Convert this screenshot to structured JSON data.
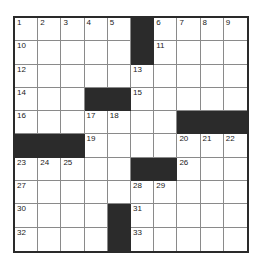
{
  "puzzle": {
    "rows": 10,
    "cols": 10,
    "colors": {
      "black": "#2b2b2b",
      "white": "#ffffff",
      "grid_line": "#8a8a8a",
      "border": "#2a2a2a"
    },
    "layout": [
      "11111#1111",
      "11111#1111",
      "1111111111",
      "111##11111",
      "1111111###",
      "###1111111",
      "11111##111",
      "1111111111",
      "1111#11111",
      "1111#11111"
    ],
    "numbers": [
      {
        "r": 0,
        "c": 0,
        "n": "1"
      },
      {
        "r": 0,
        "c": 1,
        "n": "2"
      },
      {
        "r": 0,
        "c": 2,
        "n": "3"
      },
      {
        "r": 0,
        "c": 3,
        "n": "4"
      },
      {
        "r": 0,
        "c": 4,
        "n": "5"
      },
      {
        "r": 0,
        "c": 6,
        "n": "6"
      },
      {
        "r": 0,
        "c": 7,
        "n": "7"
      },
      {
        "r": 0,
        "c": 8,
        "n": "8"
      },
      {
        "r": 0,
        "c": 9,
        "n": "9"
      },
      {
        "r": 1,
        "c": 0,
        "n": "10"
      },
      {
        "r": 1,
        "c": 6,
        "n": "11"
      },
      {
        "r": 2,
        "c": 0,
        "n": "12"
      },
      {
        "r": 2,
        "c": 5,
        "n": "13"
      },
      {
        "r": 3,
        "c": 0,
        "n": "14"
      },
      {
        "r": 3,
        "c": 5,
        "n": "15"
      },
      {
        "r": 4,
        "c": 0,
        "n": "16"
      },
      {
        "r": 4,
        "c": 3,
        "n": "17"
      },
      {
        "r": 4,
        "c": 4,
        "n": "18"
      },
      {
        "r": 5,
        "c": 3,
        "n": "19"
      },
      {
        "r": 5,
        "c": 7,
        "n": "20"
      },
      {
        "r": 5,
        "c": 8,
        "n": "21"
      },
      {
        "r": 5,
        "c": 9,
        "n": "22"
      },
      {
        "r": 6,
        "c": 0,
        "n": "23"
      },
      {
        "r": 6,
        "c": 1,
        "n": "24"
      },
      {
        "r": 6,
        "c": 2,
        "n": "25"
      },
      {
        "r": 6,
        "c": 7,
        "n": "26"
      },
      {
        "r": 7,
        "c": 0,
        "n": "27"
      },
      {
        "r": 7,
        "c": 5,
        "n": "28"
      },
      {
        "r": 7,
        "c": 6,
        "n": "29"
      },
      {
        "r": 8,
        "c": 0,
        "n": "30"
      },
      {
        "r": 8,
        "c": 5,
        "n": "31"
      },
      {
        "r": 9,
        "c": 0,
        "n": "32"
      },
      {
        "r": 9,
        "c": 5,
        "n": "33"
      }
    ]
  }
}
